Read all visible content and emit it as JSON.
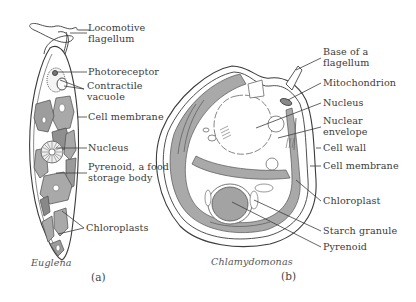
{
  "figure": {
    "panel_a": {
      "organism": "Euglena",
      "panel_label": "(a)",
      "labels": [
        {
          "id": "locomotive-flagellum",
          "line1": "Locomotive",
          "line2": "flagellum"
        },
        {
          "id": "photoreceptor",
          "line1": "Photoreceptor",
          "line2": ""
        },
        {
          "id": "contractile-vacuole",
          "line1": "Contractile",
          "line2": "vacuole"
        },
        {
          "id": "cell-membrane",
          "line1": "Cell membrane",
          "line2": ""
        },
        {
          "id": "nucleus",
          "line1": "Nucleus",
          "line2": ""
        },
        {
          "id": "pyrenoid",
          "line1": "Pyrenoid, a food",
          "line2": "storage body"
        },
        {
          "id": "chloroplasts",
          "line1": "Chloroplasts",
          "line2": ""
        }
      ]
    },
    "panel_b": {
      "organism": "Chlamydomonas",
      "panel_label": "(b)",
      "labels": [
        {
          "id": "base-of-flagellum",
          "line1": "Base of a",
          "line2": "flagellum"
        },
        {
          "id": "mitochondrion",
          "line1": "Mitochondrion",
          "line2": ""
        },
        {
          "id": "nucleus",
          "line1": "Nucleus",
          "line2": ""
        },
        {
          "id": "nuclear-envelope",
          "line1": "Nuclear",
          "line2": "envelope"
        },
        {
          "id": "cell-wall",
          "line1": "Cell wall",
          "line2": ""
        },
        {
          "id": "cell-membrane",
          "line1": "Cell membrane",
          "line2": ""
        },
        {
          "id": "chloroplast",
          "line1": "Chloroplast",
          "line2": ""
        },
        {
          "id": "starch-granule",
          "line1": "Starch granule",
          "line2": ""
        },
        {
          "id": "pyrenoid",
          "line1": "Pyrenoid",
          "line2": ""
        }
      ]
    },
    "colors": {
      "outline": "#3c3c3c",
      "chloroplast_fill": "#a9a9a9",
      "chloroplast_dark": "#8c8c8c",
      "cytoplasm": "#ffffff",
      "text": "#3a3a3a"
    }
  }
}
